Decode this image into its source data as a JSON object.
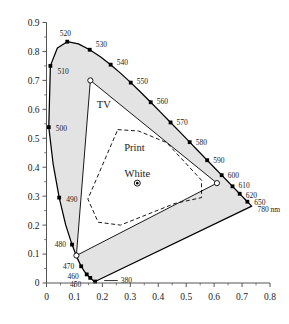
{
  "chart_data": {
    "type": "scatter",
    "title": "",
    "subtitle": "",
    "xlabel": "",
    "ylabel": "",
    "xlim": [
      0,
      0.8
    ],
    "ylim": [
      0,
      0.9
    ],
    "grid": false,
    "legend_position": "none",
    "x_ticks": [
      "0",
      "0.1",
      "0.2",
      "0.3",
      "0.4",
      "0.5",
      "0.6",
      "0.7",
      "0.8"
    ],
    "x_tick_values": [
      0,
      0.1,
      0.2,
      0.3,
      0.4,
      0.5,
      0.6,
      0.7,
      0.8
    ],
    "y_ticks": [
      "0",
      "0.1",
      "0.2",
      "0.3",
      "0.4",
      "0.5",
      "0.6",
      "0.7",
      "0.8",
      "0.9"
    ],
    "y_tick_values": [
      0,
      0.1,
      0.2,
      0.3,
      0.4,
      0.5,
      0.6,
      0.7,
      0.8,
      0.9
    ],
    "x_minor_ticks": [
      0.05,
      0.15,
      0.25,
      0.35,
      0.45,
      0.55,
      0.65,
      0.75
    ],
    "y_minor_ticks": [
      0.05,
      0.15,
      0.25,
      0.35,
      0.45,
      0.55,
      0.65,
      0.75,
      0.85
    ],
    "annotations": [
      {
        "label": "TV",
        "x": 0.205,
        "y": 0.605
      },
      {
        "label": "Print",
        "x": 0.315,
        "y": 0.455
      },
      {
        "label": "White",
        "x": 0.325,
        "y": 0.365
      },
      {
        "label": "780 nm",
        "x": 0.755,
        "y": 0.245
      }
    ],
    "series": [
      {
        "name": "spectral-locus",
        "type": "line",
        "closed": true,
        "points": [
          [
            0.1741,
            0.005
          ],
          [
            0.174,
            0.005
          ],
          [
            0.1738,
            0.0049
          ],
          [
            0.1736,
            0.0049
          ],
          [
            0.1733,
            0.0048
          ],
          [
            0.173,
            0.0048
          ],
          [
            0.1726,
            0.0048
          ],
          [
            0.1721,
            0.0048
          ],
          [
            0.1714,
            0.0051
          ],
          [
            0.1703,
            0.0058
          ],
          [
            0.1689,
            0.0069
          ],
          [
            0.1669,
            0.0086
          ],
          [
            0.1644,
            0.0109
          ],
          [
            0.1611,
            0.0138
          ],
          [
            0.1566,
            0.0177
          ],
          [
            0.151,
            0.0227
          ],
          [
            0.144,
            0.0297
          ],
          [
            0.1355,
            0.0399
          ],
          [
            0.1241,
            0.0578
          ],
          [
            0.1096,
            0.0868
          ],
          [
            0.0913,
            0.1327
          ],
          [
            0.0687,
            0.2007
          ],
          [
            0.0454,
            0.295
          ],
          [
            0.0235,
            0.4127
          ],
          [
            0.0082,
            0.5384
          ],
          [
            0.0139,
            0.7502
          ],
          [
            0.0389,
            0.812
          ],
          [
            0.0743,
            0.8338
          ],
          [
            0.1142,
            0.8262
          ],
          [
            0.1547,
            0.8059
          ],
          [
            0.1929,
            0.7816
          ],
          [
            0.2296,
            0.7543
          ],
          [
            0.2658,
            0.7243
          ],
          [
            0.3016,
            0.6923
          ],
          [
            0.3373,
            0.6589
          ],
          [
            0.3731,
            0.6245
          ],
          [
            0.4087,
            0.5896
          ],
          [
            0.4441,
            0.5547
          ],
          [
            0.4788,
            0.5202
          ],
          [
            0.5125,
            0.4866
          ],
          [
            0.5448,
            0.4544
          ],
          [
            0.5752,
            0.4242
          ],
          [
            0.6029,
            0.3965
          ],
          [
            0.627,
            0.3725
          ],
          [
            0.6482,
            0.3514
          ],
          [
            0.6658,
            0.334
          ],
          [
            0.6801,
            0.3197
          ],
          [
            0.6915,
            0.3083
          ],
          [
            0.7006,
            0.2993
          ],
          [
            0.7079,
            0.292
          ],
          [
            0.714,
            0.2859
          ],
          [
            0.719,
            0.2809
          ],
          [
            0.723,
            0.277
          ],
          [
            0.726,
            0.274
          ],
          [
            0.7283,
            0.2717
          ],
          [
            0.73,
            0.27
          ],
          [
            0.7311,
            0.2689
          ],
          [
            0.732,
            0.268
          ],
          [
            0.7327,
            0.2673
          ],
          [
            0.7334,
            0.2666
          ],
          [
            0.734,
            0.266
          ],
          [
            0.7344,
            0.2656
          ],
          [
            0.7346,
            0.2654
          ]
        ]
      },
      {
        "name": "tv-gamut",
        "type": "polygon",
        "vertices": [
          [
            0.157,
            0.7
          ],
          [
            0.61,
            0.345
          ],
          [
            0.107,
            0.095
          ]
        ]
      },
      {
        "name": "print-gamut",
        "type": "polygon",
        "dashed": true,
        "vertices": [
          [
            0.255,
            0.53
          ],
          [
            0.33,
            0.525
          ],
          [
            0.43,
            0.485
          ],
          [
            0.555,
            0.355
          ],
          [
            0.555,
            0.295
          ],
          [
            0.46,
            0.275
          ],
          [
            0.265,
            0.2
          ],
          [
            0.185,
            0.21
          ],
          [
            0.148,
            0.29
          ]
        ]
      },
      {
        "name": "white-point",
        "type": "marker",
        "point": [
          0.325,
          0.345
        ]
      }
    ],
    "wavelength_markers": [
      {
        "label": "450",
        "x": 0.1566,
        "y": 0.0177,
        "lx": -9,
        "ly": 9,
        "anchor": "end"
      },
      {
        "label": "460",
        "x": 0.144,
        "y": 0.0297,
        "lx": -8,
        "ly": 5,
        "anchor": "end"
      },
      {
        "label": "470",
        "x": 0.1241,
        "y": 0.0578,
        "lx": -7,
        "ly": 3,
        "anchor": "end"
      },
      {
        "label": "480",
        "x": 0.0913,
        "y": 0.1327,
        "lx": -6,
        "ly": 2,
        "anchor": "end"
      },
      {
        "label": "490",
        "x": 0.0454,
        "y": 0.295,
        "lx": 7,
        "ly": 4,
        "anchor": "start"
      },
      {
        "label": "500",
        "x": 0.0082,
        "y": 0.5384,
        "lx": 7,
        "ly": 4,
        "anchor": "start"
      },
      {
        "label": "510",
        "x": 0.0139,
        "y": 0.7502,
        "lx": 7,
        "ly": 8,
        "anchor": "start"
      },
      {
        "label": "520",
        "x": 0.0743,
        "y": 0.8338,
        "lx": -2,
        "ly": -6,
        "anchor": "middle"
      },
      {
        "label": "530",
        "x": 0.1547,
        "y": 0.8059,
        "lx": 6,
        "ly": -3,
        "anchor": "start"
      },
      {
        "label": "540",
        "x": 0.2296,
        "y": 0.7543,
        "lx": 6,
        "ly": 0,
        "anchor": "start"
      },
      {
        "label": "550",
        "x": 0.3016,
        "y": 0.6923,
        "lx": 6,
        "ly": 1,
        "anchor": "start"
      },
      {
        "label": "560",
        "x": 0.3731,
        "y": 0.6245,
        "lx": 6,
        "ly": 2,
        "anchor": "start"
      },
      {
        "label": "570",
        "x": 0.4441,
        "y": 0.5547,
        "lx": 6,
        "ly": 3,
        "anchor": "start"
      },
      {
        "label": "580",
        "x": 0.5125,
        "y": 0.4866,
        "lx": 6,
        "ly": 3,
        "anchor": "start"
      },
      {
        "label": "590",
        "x": 0.5752,
        "y": 0.4242,
        "lx": 6,
        "ly": 3,
        "anchor": "start"
      },
      {
        "label": "600",
        "x": 0.627,
        "y": 0.3725,
        "lx": 6,
        "ly": 3,
        "anchor": "start"
      },
      {
        "label": "610",
        "x": 0.6658,
        "y": 0.334,
        "lx": 6,
        "ly": 2,
        "anchor": "start"
      },
      {
        "label": "620",
        "x": 0.6915,
        "y": 0.3083,
        "lx": 6,
        "ly": 4,
        "anchor": "start"
      },
      {
        "label": "650",
        "x": 0.719,
        "y": 0.2809,
        "lx": 7,
        "ly": 3,
        "anchor": "start"
      }
    ],
    "extra_markers": [
      {
        "label": "380",
        "x": 0.1741,
        "y": 0.005,
        "leader_to_x": 0.255,
        "leader_to_y": 0.03
      }
    ],
    "colors": {
      "locus_line": "#000000",
      "fill_gamut_outside": "#e3e3e3",
      "gamut_line": "#000000",
      "print_dash": "#000000",
      "axis": "#555555",
      "text": "#1a1a1a",
      "background": "#ffffff"
    }
  },
  "axis": {
    "x_label": "",
    "y_label": ""
  }
}
